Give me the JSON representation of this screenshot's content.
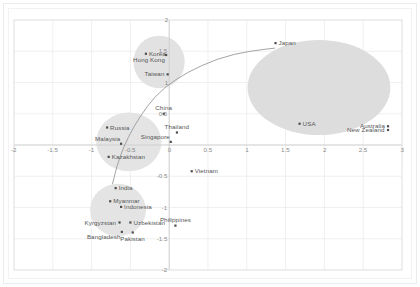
{
  "chart_data": {
    "type": "scatter",
    "title": "",
    "xlabel": "",
    "ylabel": "",
    "xlim": [
      -2,
      3
    ],
    "ylim": [
      -2,
      2
    ],
    "xticks": [
      "-2",
      "-1.5",
      "-1",
      "-0.5",
      "0",
      "0.5",
      "1",
      "1.5",
      "2",
      "2.5",
      "3"
    ],
    "yticks": [
      "2",
      "1.5",
      "1",
      "0.5",
      "0",
      "-0.5",
      "-1",
      "-1.5",
      "-2"
    ],
    "xtick_values": [
      -2,
      -1.5,
      -1,
      -0.5,
      0,
      0.5,
      1,
      1.5,
      2,
      2.5,
      3
    ],
    "ytick_values": [
      2,
      1.5,
      1,
      0.5,
      0,
      -0.5,
      -1,
      -1.5,
      -2
    ],
    "grid": true,
    "legend": "none",
    "points": [
      {
        "label": "Korea",
        "x": -0.3,
        "y": 1.46,
        "label_pos": "right"
      },
      {
        "label": "Hong Kong",
        "x": -0.04,
        "y": 1.44,
        "label_pos": "below-left"
      },
      {
        "label": "Taiwan",
        "x": -0.02,
        "y": 1.13,
        "label_pos": "left"
      },
      {
        "label": "Japan",
        "x": 1.37,
        "y": 1.63,
        "label_pos": "right"
      },
      {
        "label": "China",
        "x": -0.07,
        "y": 0.5,
        "label_pos": "above"
      },
      {
        "label": "Thailand",
        "x": 0.1,
        "y": 0.2,
        "label_pos": "above"
      },
      {
        "label": "Singapore",
        "x": 0.02,
        "y": 0.05,
        "label_pos": "above-left"
      },
      {
        "label": "Russia",
        "x": -0.8,
        "y": 0.28,
        "label_pos": "right"
      },
      {
        "label": "Malaysia",
        "x": -0.62,
        "y": 0.02,
        "label_pos": "above-left"
      },
      {
        "label": "Kazakhstan",
        "x": -0.78,
        "y": -0.19,
        "label_pos": "right"
      },
      {
        "label": "USA",
        "x": 1.68,
        "y": 0.34,
        "label_pos": "right"
      },
      {
        "label": "Australia",
        "x": 2.82,
        "y": 0.3,
        "label_pos": "left"
      },
      {
        "label": "New Zealand",
        "x": 2.82,
        "y": 0.24,
        "label_pos": "left"
      },
      {
        "label": "Vietnam",
        "x": 0.29,
        "y": -0.42,
        "label_pos": "right"
      },
      {
        "label": "India",
        "x": -0.69,
        "y": -0.69,
        "label_pos": "right"
      },
      {
        "label": "Myanmar",
        "x": -0.76,
        "y": -0.9,
        "label_pos": "right"
      },
      {
        "label": "Indonesia",
        "x": -0.62,
        "y": -0.99,
        "label_pos": "right"
      },
      {
        "label": "Kyrgyzstan",
        "x": -0.64,
        "y": -1.24,
        "label_pos": "left"
      },
      {
        "label": "Uzbekistan",
        "x": -0.5,
        "y": -1.24,
        "label_pos": "right"
      },
      {
        "label": "Bangladesh",
        "x": -0.61,
        "y": -1.39,
        "label_pos": "below-left"
      },
      {
        "label": "Pakistan",
        "x": -0.47,
        "y": -1.4,
        "label_pos": "below"
      },
      {
        "label": "Philippines",
        "x": 0.08,
        "y": -1.29,
        "label_pos": "above"
      }
    ],
    "clusters": [
      {
        "name": "high-income-east-asia",
        "cx": -0.13,
        "cy": 1.33,
        "rx": 0.33,
        "ry": 0.42,
        "color": "#e2e2e2"
      },
      {
        "name": "developed-west",
        "cx": 1.93,
        "cy": 0.92,
        "rx": 0.92,
        "ry": 0.76,
        "color": "#dddddd"
      },
      {
        "name": "upper-middle",
        "cx": -0.52,
        "cy": 0.05,
        "rx": 0.42,
        "ry": 0.47,
        "color": "#e4e4e4"
      },
      {
        "name": "south-central-asia",
        "cx": -0.66,
        "cy": -1.04,
        "rx": 0.36,
        "ry": 0.42,
        "color": "#e4e4e4"
      }
    ],
    "trend_curve": {
      "name": "logarithmic-fit",
      "color": "#9a9a9a",
      "points": [
        [
          -0.73,
          -0.62
        ],
        [
          -0.7,
          -0.47
        ],
        [
          -0.67,
          -0.33
        ],
        [
          -0.63,
          -0.18
        ],
        [
          -0.58,
          -0.02
        ],
        [
          -0.52,
          0.14
        ],
        [
          -0.45,
          0.3
        ],
        [
          -0.37,
          0.46
        ],
        [
          -0.28,
          0.62
        ],
        [
          -0.18,
          0.77
        ],
        [
          -0.06,
          0.91
        ],
        [
          0.08,
          1.04
        ],
        [
          0.24,
          1.16
        ],
        [
          0.42,
          1.27
        ],
        [
          0.62,
          1.37
        ],
        [
          0.84,
          1.45
        ],
        [
          1.05,
          1.5
        ],
        [
          1.22,
          1.53
        ],
        [
          1.36,
          1.55
        ]
      ]
    }
  }
}
